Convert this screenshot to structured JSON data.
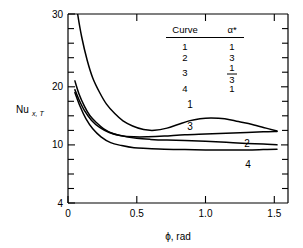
{
  "chart_data": {
    "type": "line",
    "title": "",
    "xlabel": "ϕ, rad",
    "ylabel": "Nu",
    "ylabel_sub": "x, T",
    "xlim": [
      0,
      1.6
    ],
    "ylim": [
      4,
      30
    ],
    "xticks": [
      0,
      0.5,
      1.0,
      1.5
    ],
    "xticklabels": [
      "0",
      "0.5",
      "1.0",
      "1.5"
    ],
    "yticks": [
      4,
      6,
      8,
      10,
      12,
      14,
      16,
      18,
      20,
      22,
      24,
      26,
      28,
      30
    ],
    "yticklabels_shown": [
      "4",
      "10",
      "20",
      "30"
    ],
    "yticklabel_values": [
      4,
      10,
      20,
      30
    ],
    "grid": false,
    "legend_position": "upper-center-inside",
    "series": [
      {
        "name": "1",
        "alpha_star": "1",
        "inline_label": "1",
        "points": [
          [
            0.04,
            34.0
          ],
          [
            0.07,
            30.0
          ],
          [
            0.1,
            26.8
          ],
          [
            0.14,
            23.6
          ],
          [
            0.18,
            21.2
          ],
          [
            0.23,
            19.2
          ],
          [
            0.28,
            17.6
          ],
          [
            0.34,
            16.3
          ],
          [
            0.4,
            15.3
          ],
          [
            0.47,
            14.6
          ],
          [
            0.55,
            14.1
          ],
          [
            0.63,
            14.0
          ],
          [
            0.72,
            14.3
          ],
          [
            0.8,
            14.8
          ],
          [
            0.88,
            15.3
          ],
          [
            0.96,
            15.6
          ],
          [
            1.04,
            15.7
          ],
          [
            1.14,
            15.6
          ],
          [
            1.24,
            15.2
          ],
          [
            1.34,
            14.8
          ],
          [
            1.44,
            14.3
          ],
          [
            1.52,
            13.9
          ]
        ]
      },
      {
        "name": "2",
        "alpha_star": "3",
        "inline_label": "2",
        "points": [
          [
            0.05,
            20.8
          ],
          [
            0.08,
            19.0
          ],
          [
            0.12,
            17.3
          ],
          [
            0.16,
            16.0
          ],
          [
            0.21,
            15.0
          ],
          [
            0.26,
            14.2
          ],
          [
            0.32,
            13.6
          ],
          [
            0.4,
            13.2
          ],
          [
            0.5,
            12.9
          ],
          [
            0.6,
            12.75
          ],
          [
            0.72,
            12.65
          ],
          [
            0.85,
            12.6
          ],
          [
            1.0,
            12.5
          ],
          [
            1.15,
            12.35
          ],
          [
            1.3,
            12.2
          ],
          [
            1.42,
            12.1
          ],
          [
            1.52,
            12.0
          ]
        ]
      },
      {
        "name": "3",
        "alpha_star": "1/3",
        "inline_label": "3",
        "points": [
          [
            0.05,
            19.6
          ],
          [
            0.08,
            18.2
          ],
          [
            0.12,
            16.7
          ],
          [
            0.17,
            15.4
          ],
          [
            0.23,
            14.4
          ],
          [
            0.3,
            13.7
          ],
          [
            0.38,
            13.3
          ],
          [
            0.48,
            13.1
          ],
          [
            0.58,
            13.1
          ],
          [
            0.7,
            13.2
          ],
          [
            0.85,
            13.4
          ],
          [
            1.0,
            13.5
          ],
          [
            1.15,
            13.6
          ],
          [
            1.3,
            13.7
          ],
          [
            1.42,
            13.8
          ],
          [
            1.52,
            13.85
          ]
        ]
      },
      {
        "name": "4",
        "alpha_star": "1",
        "inline_label": "4",
        "points": [
          [
            0.05,
            19.2
          ],
          [
            0.09,
            17.2
          ],
          [
            0.13,
            15.6
          ],
          [
            0.18,
            14.2
          ],
          [
            0.24,
            13.1
          ],
          [
            0.31,
            12.3
          ],
          [
            0.39,
            11.9
          ],
          [
            0.48,
            11.6
          ],
          [
            0.58,
            11.5
          ],
          [
            0.7,
            11.4
          ],
          [
            0.85,
            11.35
          ],
          [
            1.0,
            11.3
          ],
          [
            1.15,
            11.3
          ],
          [
            1.3,
            11.3
          ],
          [
            1.42,
            11.35
          ],
          [
            1.52,
            11.4
          ]
        ]
      }
    ],
    "legend": {
      "header_curve": "Curve",
      "header_alpha": "α*",
      "rows": [
        {
          "curve": "1",
          "alpha": "1",
          "is_fraction": false
        },
        {
          "curve": "2",
          "alpha": "3",
          "is_fraction": false
        },
        {
          "curve": "3",
          "alpha_num": "1",
          "alpha_den": "3",
          "is_fraction": true
        },
        {
          "curve": "4",
          "alpha": "1",
          "is_fraction": false
        }
      ]
    }
  }
}
